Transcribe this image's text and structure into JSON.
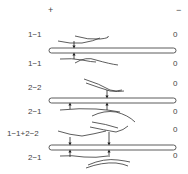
{
  "header": {
    "plus_label": "+",
    "minus_label": "−"
  },
  "panels": [
    {
      "top_label": "1−1",
      "top_value": "0",
      "bottom_label": "1−1",
      "bottom_value": "0"
    },
    {
      "top_label": "2−2",
      "top_value": "0",
      "bottom_label": "2−1",
      "bottom_value": "0"
    },
    {
      "top_label": "1−1+2−2",
      "top_value": "0",
      "bottom_label": "2−1",
      "bottom_value": "0"
    }
  ],
  "colors": {
    "stroke": "#333333",
    "text": "#444444",
    "background": "#ffffff"
  }
}
